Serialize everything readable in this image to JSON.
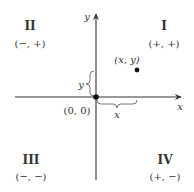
{
  "diagram": {
    "type": "cartesian-plane-quadrants",
    "axes": {
      "x_label": "x",
      "y_label": "y"
    },
    "origin_label": "(0, 0)",
    "point": {
      "label": "(x, y)",
      "x_measure_label": "x",
      "y_measure_label": "y"
    },
    "quadrants": [
      {
        "id": "I",
        "numeral": "I",
        "signs": "(+, +)"
      },
      {
        "id": "II",
        "numeral": "II",
        "signs": "(−, +)"
      },
      {
        "id": "III",
        "numeral": "III",
        "signs": "(−, −)"
      },
      {
        "id": "IV",
        "numeral": "IV",
        "signs": "(+, −)"
      }
    ],
    "colors": {
      "ink": "#333333",
      "background": "#ffffff"
    }
  }
}
